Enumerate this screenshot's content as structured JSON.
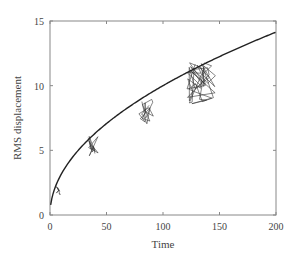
{
  "chart_data": {
    "type": "line",
    "title": "",
    "xlabel": "Time",
    "ylabel": "RMS displacement",
    "xlim": [
      0,
      200
    ],
    "ylim": [
      0,
      15
    ],
    "xticks": [
      0,
      50,
      100,
      150,
      200
    ],
    "yticks": [
      0,
      5,
      10,
      15
    ],
    "grid": false,
    "legend": null,
    "series": [
      {
        "name": "sqrt(t) theoretical curve",
        "kind": "curve",
        "formula": "sqrt(t)",
        "x": [
          1,
          5,
          10,
          20,
          30,
          40,
          50,
          75,
          100,
          125,
          150,
          175,
          200
        ],
        "values": [
          1.0,
          2.24,
          3.16,
          4.47,
          5.48,
          6.32,
          7.07,
          8.66,
          10.0,
          11.18,
          12.25,
          13.23,
          14.14
        ]
      },
      {
        "name": "random walk clusters",
        "kind": "scatter-trajectory",
        "clusters": [
          {
            "t_center": 8,
            "rms_center": 1.9,
            "spread_t": 3,
            "spread_rms": 0.4
          },
          {
            "t_center": 38,
            "rms_center": 5.3,
            "spread_t": 5,
            "spread_rms": 0.8
          },
          {
            "t_center": 85,
            "rms_center": 8.0,
            "spread_t": 7,
            "spread_rms": 1.0
          },
          {
            "t_center": 135,
            "rms_center": 10.2,
            "spread_t": 14,
            "spread_rms": 1.6
          }
        ]
      }
    ]
  },
  "axes": {
    "x_label": "Time",
    "y_label": "RMS displacement",
    "x_tick_labels": [
      "0",
      "50",
      "100",
      "150",
      "200"
    ],
    "y_tick_labels": [
      "0",
      "5",
      "10",
      "15"
    ]
  }
}
